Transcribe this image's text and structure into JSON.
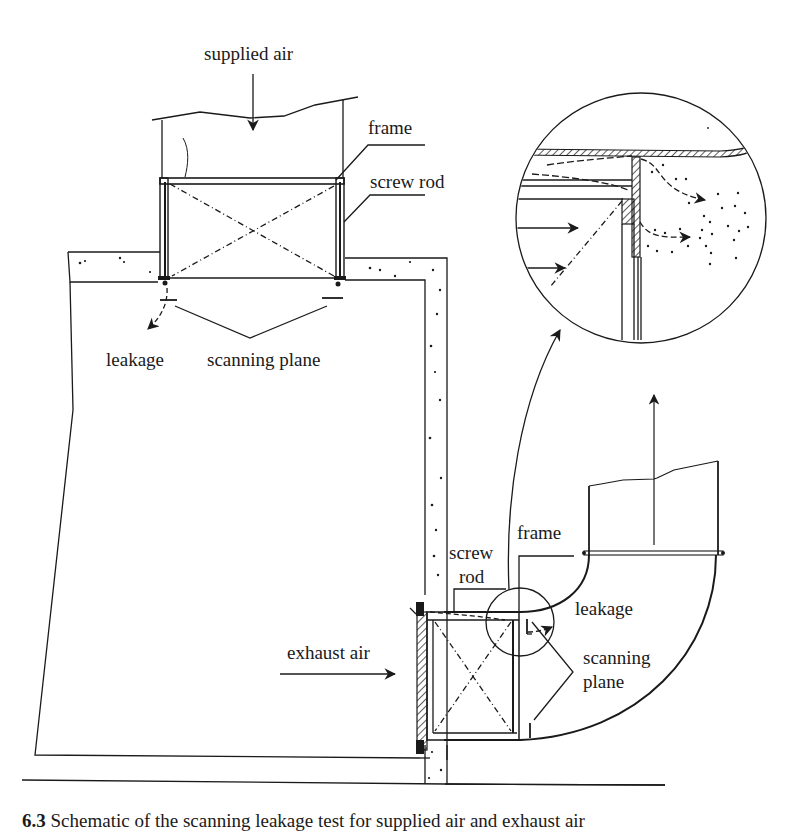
{
  "figure": {
    "labels": {
      "supplied_air": "supplied air",
      "frame_top": "frame",
      "screw_rod_top": "screw rod",
      "leakage_top": "leakage",
      "scanning_plane_top": "scanning plane",
      "screw_rod_bottom_line1": "screw",
      "screw_rod_bottom_line2": "rod",
      "frame_bottom": "frame",
      "leakage_bottom": "leakage",
      "exhaust_air": "exhaust air",
      "scanning_plane_bottom_line1": "scanning",
      "scanning_plane_bottom_line2": "plane"
    },
    "caption": {
      "number": "6.3",
      "text": "Schematic of the scanning leakage test for supplied air and exhaust air"
    },
    "colors": {
      "ink": "#1a1a1a",
      "background": "#ffffff"
    }
  }
}
